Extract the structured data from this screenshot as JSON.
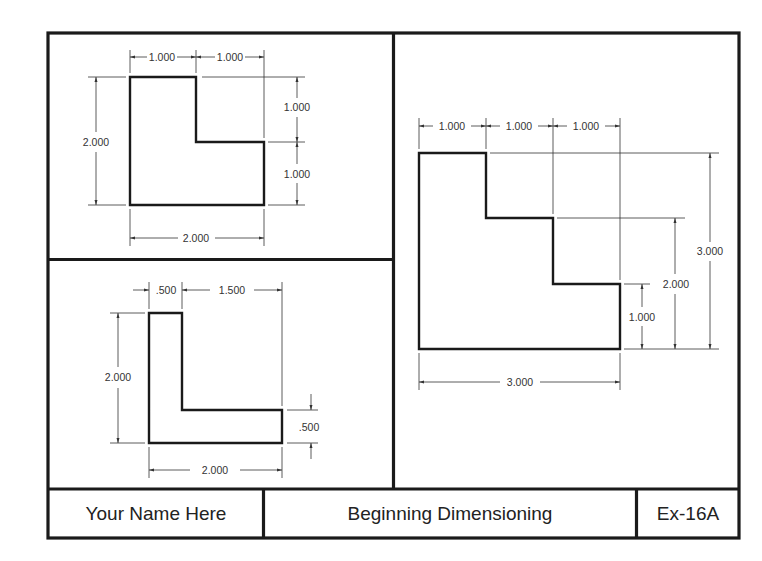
{
  "title_block": {
    "name": "Your Name Here",
    "title": "Beginning Dimensioning",
    "exercise": "Ex-16A"
  },
  "colors": {
    "line": "#1a1a1a",
    "dim_line": "#333333",
    "background": "#ffffff"
  },
  "views": [
    {
      "id": "view-1",
      "shape": "L-shape (notch top-right)",
      "dimensions": {
        "top_left": "1.000",
        "top_right": "1.000",
        "left_overall": "2.000",
        "right_upper": "1.000",
        "right_lower": "1.000",
        "bottom_overall": "2.000"
      }
    },
    {
      "id": "view-2",
      "shape": "L-shape (thin)",
      "dimensions": {
        "top_left": ".500",
        "top_right": "1.500",
        "left_overall": "2.000",
        "right_thickness": ".500",
        "bottom_overall": "2.000"
      }
    },
    {
      "id": "view-3",
      "shape": "Stair-step",
      "dimensions": {
        "top_1": "1.000",
        "top_2": "1.000",
        "top_3": "1.000",
        "right_1": "1.000",
        "right_2": "2.000",
        "right_3": "3.000",
        "bottom_overall": "3.000"
      }
    }
  ]
}
